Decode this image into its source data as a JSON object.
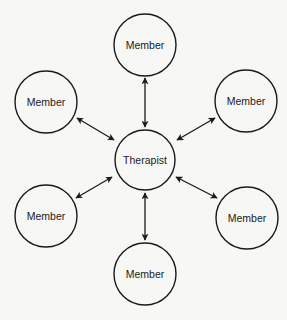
{
  "diagram": {
    "type": "star",
    "colors": {
      "stroke": "#1a1a1a",
      "background": "#f7f7f5"
    },
    "center": {
      "id": "therapist",
      "label": "Therapist",
      "cx": 145,
      "cy": 160,
      "r": 30
    },
    "nodes": [
      {
        "id": "member-top",
        "label": "Member",
        "cx": 145,
        "cy": 45,
        "r": 31
      },
      {
        "id": "member-upper-left",
        "label": "Member",
        "cx": 46,
        "cy": 102,
        "r": 31
      },
      {
        "id": "member-upper-right",
        "label": "Member",
        "cx": 246,
        "cy": 101,
        "r": 31
      },
      {
        "id": "member-lower-left",
        "label": "Member",
        "cx": 46,
        "cy": 216,
        "r": 31
      },
      {
        "id": "member-lower-right",
        "label": "Member",
        "cx": 247,
        "cy": 218,
        "r": 31
      },
      {
        "id": "member-bottom",
        "label": "Member",
        "cx": 145,
        "cy": 274,
        "r": 31
      }
    ],
    "edges": [
      {
        "from": "therapist",
        "to": "member-top",
        "bidirectional": true,
        "x1": 145,
        "y1": 78,
        "x2": 145,
        "y2": 127
      },
      {
        "from": "therapist",
        "to": "member-upper-left",
        "bidirectional": true,
        "x1": 77,
        "y1": 118,
        "x2": 114,
        "y2": 140
      },
      {
        "from": "therapist",
        "to": "member-upper-right",
        "bidirectional": true,
        "x1": 215,
        "y1": 118,
        "x2": 177,
        "y2": 140
      },
      {
        "from": "therapist",
        "to": "member-lower-left",
        "bidirectional": true,
        "x1": 76,
        "y1": 198,
        "x2": 112,
        "y2": 177
      },
      {
        "from": "therapist",
        "to": "member-lower-right",
        "bidirectional": true,
        "x1": 217,
        "y1": 198,
        "x2": 176,
        "y2": 177
      },
      {
        "from": "therapist",
        "to": "member-bottom",
        "bidirectional": true,
        "x1": 145,
        "y1": 193,
        "x2": 145,
        "y2": 240
      }
    ]
  }
}
